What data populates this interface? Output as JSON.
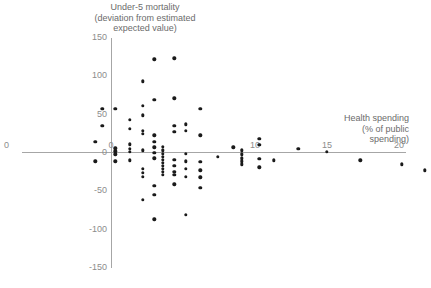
{
  "chart_data": {
    "type": "scatter",
    "title": "",
    "ylabel": "Under-5 mortality\n(deviation from estimated\nexpected value)",
    "xlabel": "Health spending\n(% of public\nspending)",
    "xlim": [
      -1.5,
      25.8
    ],
    "ylim": [
      -150,
      150
    ],
    "grid": false,
    "legend": null,
    "xticks": [
      0,
      10,
      15,
      20,
      25
    ],
    "xtick_labels": [
      "0",
      "10",
      "15",
      "20",
      "25"
    ],
    "yticks": [
      150,
      100,
      50,
      0,
      -50,
      -100,
      -150
    ],
    "ytick_labels": [
      "150",
      "100",
      "50",
      "0",
      "-50",
      "-100",
      "-150"
    ],
    "x_origin_label": "0",
    "x_left_edge_label": "0",
    "points": [
      [
        -1.1,
        13
      ],
      [
        -1.1,
        -12
      ],
      [
        -0.6,
        56
      ],
      [
        -0.6,
        34
      ],
      [
        0.3,
        56
      ],
      [
        0.3,
        5
      ],
      [
        0.3,
        1
      ],
      [
        0.3,
        -3
      ],
      [
        0.3,
        -12
      ],
      [
        1.3,
        42
      ],
      [
        1.3,
        30
      ],
      [
        1.3,
        10
      ],
      [
        1.3,
        4
      ],
      [
        1.3,
        0
      ],
      [
        1.3,
        -11
      ],
      [
        2.2,
        92
      ],
      [
        2.2,
        60
      ],
      [
        2.2,
        48
      ],
      [
        2.2,
        28
      ],
      [
        2.2,
        24
      ],
      [
        2.2,
        2
      ],
      [
        2.2,
        -22
      ],
      [
        2.2,
        -27
      ],
      [
        2.2,
        -32
      ],
      [
        2.2,
        -62
      ],
      [
        3.0,
        121
      ],
      [
        3.0,
        68
      ],
      [
        3.0,
        22
      ],
      [
        3.0,
        13
      ],
      [
        3.0,
        6
      ],
      [
        3.0,
        -1
      ],
      [
        3.0,
        -8
      ],
      [
        3.0,
        -44
      ],
      [
        3.0,
        -56
      ],
      [
        3.0,
        -88
      ],
      [
        3.6,
        7
      ],
      [
        3.6,
        2
      ],
      [
        3.6,
        -2
      ],
      [
        3.6,
        -6
      ],
      [
        3.6,
        -10
      ],
      [
        3.6,
        -14
      ],
      [
        3.6,
        -18
      ],
      [
        3.6,
        -22
      ],
      [
        3.6,
        -26
      ],
      [
        3.6,
        -30
      ],
      [
        4.4,
        122
      ],
      [
        4.4,
        70
      ],
      [
        4.4,
        34
      ],
      [
        4.4,
        26
      ],
      [
        4.4,
        -10
      ],
      [
        4.4,
        -18
      ],
      [
        4.4,
        -26
      ],
      [
        4.4,
        -30
      ],
      [
        4.4,
        -42
      ],
      [
        5.2,
        36
      ],
      [
        5.2,
        28
      ],
      [
        5.2,
        -2
      ],
      [
        5.2,
        -12
      ],
      [
        5.2,
        -22
      ],
      [
        5.2,
        -32
      ],
      [
        5.2,
        -82
      ],
      [
        6.2,
        56
      ],
      [
        6.2,
        22
      ],
      [
        6.2,
        -13
      ],
      [
        6.2,
        -24
      ],
      [
        6.2,
        -33
      ],
      [
        6.2,
        -47
      ],
      [
        7.4,
        -6
      ],
      [
        8.5,
        6
      ],
      [
        9.1,
        2
      ],
      [
        9.1,
        -3
      ],
      [
        9.1,
        -8
      ],
      [
        9.1,
        -12
      ],
      [
        9.1,
        -16
      ],
      [
        10.3,
        17
      ],
      [
        10.3,
        9
      ],
      [
        10.3,
        -9
      ],
      [
        10.3,
        -20
      ],
      [
        11.3,
        -11
      ],
      [
        13.0,
        4
      ],
      [
        15.0,
        0
      ],
      [
        17.3,
        -11
      ],
      [
        20.2,
        -16
      ],
      [
        21.8,
        -24
      ]
    ]
  }
}
